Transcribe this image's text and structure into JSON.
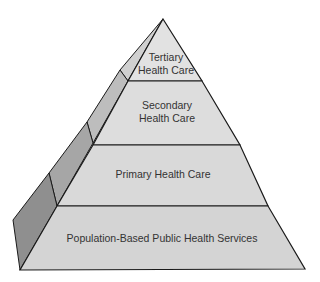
{
  "diagram": {
    "type": "pyramid",
    "colors": {
      "front_face": "#dcdcdc",
      "side_face_light": "#b9b9b9",
      "side_face_dark": "#8f8f8f",
      "outline": "#1a1a1a",
      "text": "#333333"
    },
    "tiers": [
      {
        "level": 1,
        "lines": [
          "Tertiary",
          "Health Care"
        ]
      },
      {
        "level": 2,
        "lines": [
          "Secondary",
          "Health Care"
        ]
      },
      {
        "level": 3,
        "lines": [
          "Primary Health Care"
        ]
      },
      {
        "level": 4,
        "lines": [
          "Population-Based Public Health Services"
        ]
      }
    ]
  }
}
